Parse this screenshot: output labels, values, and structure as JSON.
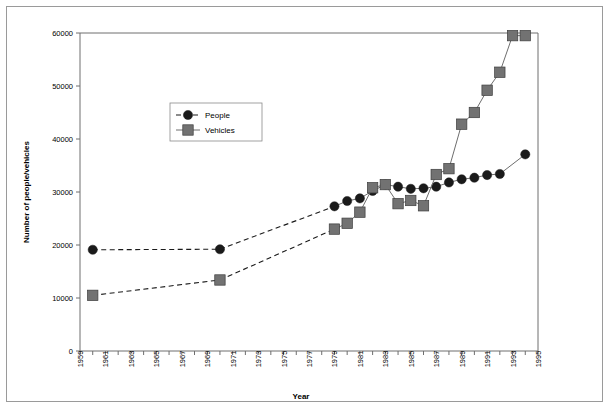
{
  "chart_data": {
    "type": "line",
    "title": "",
    "xlabel": "Year",
    "ylabel": "Number of people/vehicles",
    "xlim": [
      1959,
      1995
    ],
    "ylim": [
      0,
      60000
    ],
    "ytick_values": [
      0,
      10000,
      20000,
      30000,
      40000,
      50000,
      60000
    ],
    "ytick_labels": [
      "0",
      "10000",
      "20000",
      "30000",
      "40000",
      "50000",
      "60000"
    ],
    "xtick_values": [
      1959,
      1960,
      1961,
      1962,
      1963,
      1964,
      1965,
      1966,
      1967,
      1968,
      1969,
      1970,
      1971,
      1972,
      1973,
      1974,
      1975,
      1976,
      1977,
      1978,
      1979,
      1980,
      1981,
      1982,
      1983,
      1984,
      1985,
      1986,
      1987,
      1988,
      1989,
      1990,
      1991,
      1992,
      1993,
      1994,
      1995
    ],
    "xtick_labels": [
      "1959",
      "",
      "1961",
      "",
      "1963",
      "",
      "1965",
      "",
      "1967",
      "",
      "1969",
      "",
      "1971",
      "",
      "1973",
      "",
      "1975",
      "",
      "1977",
      "",
      "1979",
      "",
      "1981",
      "",
      "1983",
      "",
      "1985",
      "",
      "1987",
      "",
      "1989",
      "",
      "1991",
      "",
      "1993",
      "",
      "1995"
    ],
    "grid": false,
    "legend_position": "upper-left-inside",
    "series": [
      {
        "name": "People",
        "marker": "circle",
        "color": "#1a1a1a",
        "x": [
          1960,
          1970,
          1979,
          1980,
          1981,
          1982,
          1983,
          1984,
          1985,
          1986,
          1987,
          1988,
          1989,
          1990,
          1991,
          1992,
          1994
        ],
        "values": [
          19100,
          19200,
          27300,
          28300,
          28800,
          30200,
          31400,
          31000,
          30600,
          30700,
          31000,
          31800,
          32400,
          32700,
          33200,
          33400,
          37100
        ]
      },
      {
        "name": "Vehicles",
        "marker": "square",
        "color": "#727272",
        "x": [
          1960,
          1970,
          1979,
          1980,
          1981,
          1982,
          1983,
          1984,
          1985,
          1986,
          1987,
          1988,
          1989,
          1990,
          1991,
          1992,
          1993,
          1994
        ],
        "values": [
          10500,
          13400,
          23000,
          24100,
          26200,
          30800,
          31400,
          27800,
          28400,
          27400,
          33300,
          34400,
          42800,
          45000,
          49200,
          52600,
          59500,
          59500
        ]
      }
    ]
  },
  "legend": {
    "entries": [
      {
        "label": "People"
      },
      {
        "label": "Vehicles"
      }
    ]
  },
  "axis_titles": {
    "x": "Year",
    "y": "Number of people/vehicles"
  }
}
